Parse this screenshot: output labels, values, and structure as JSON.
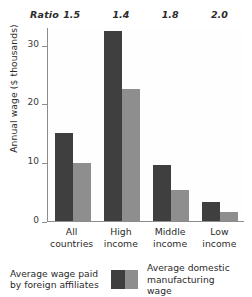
{
  "chart_data": {
    "type": "bar",
    "title": "",
    "xlabel": "",
    "ylabel": "Annual wage ($ thousands)",
    "ylim": [
      0,
      33
    ],
    "yticks": [
      0,
      10,
      20,
      30
    ],
    "grid": false,
    "legend_position": "bottom",
    "categories": [
      "All countries",
      "High income",
      "Middle income",
      "Low income"
    ],
    "category_lines": [
      [
        "All",
        "countries"
      ],
      [
        "High",
        "income"
      ],
      [
        "Middle",
        "income"
      ],
      [
        "Low",
        "income"
      ]
    ],
    "series": [
      {
        "name": "Average wage paid by foreign affiliates",
        "color": "#3f3f3f",
        "values": [
          15.0,
          32.3,
          9.5,
          3.3
        ]
      },
      {
        "name": "Average domestic manufacturing wage",
        "color": "#8e8e8e",
        "values": [
          9.8,
          22.5,
          5.2,
          1.6
        ]
      }
    ],
    "annotations": {
      "ratio_label": "Ratio",
      "ratio_values": [
        "1.5",
        "1.4",
        "1.8",
        "2.0"
      ]
    }
  },
  "legend": {
    "left_label_line1": "Average wage paid",
    "left_label_line2": "by foreign affiliates",
    "right_label_line1": "Average domestic",
    "right_label_line2": "manufacturing wage"
  }
}
